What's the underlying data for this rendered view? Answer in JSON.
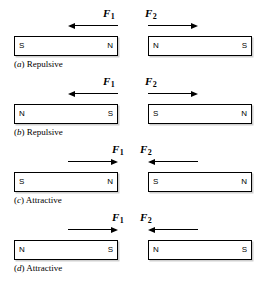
{
  "figure": {
    "force_labels": {
      "f1": "F",
      "f1_sub": "1",
      "f2": "F",
      "f2_sub": "2"
    },
    "rows": [
      {
        "id": "a",
        "tag_open": "(",
        "tag_letter": "a",
        "tag_close": ")",
        "caption": " Repulsive",
        "left_magnet": {
          "start_pole": "S",
          "end_pole": "N"
        },
        "right_magnet": {
          "start_pole": "N",
          "end_pole": "S"
        },
        "f1_direction": "left",
        "f2_direction": "right"
      },
      {
        "id": "b",
        "tag_open": "(",
        "tag_letter": "b",
        "tag_close": ")",
        "caption": " Repulsive",
        "left_magnet": {
          "start_pole": "N",
          "end_pole": "S"
        },
        "right_magnet": {
          "start_pole": "S",
          "end_pole": "N"
        },
        "f1_direction": "left",
        "f2_direction": "right"
      },
      {
        "id": "c",
        "tag_open": "(",
        "tag_letter": "c",
        "tag_close": ")",
        "caption": " Attractive",
        "left_magnet": {
          "start_pole": "S",
          "end_pole": "N"
        },
        "right_magnet": {
          "start_pole": "S",
          "end_pole": "N"
        },
        "f1_direction": "right",
        "f2_direction": "left"
      },
      {
        "id": "d",
        "tag_open": "(",
        "tag_letter": "d",
        "tag_close": ")",
        "caption": " Attractive",
        "left_magnet": {
          "start_pole": "N",
          "end_pole": "S"
        },
        "right_magnet": {
          "start_pole": "N",
          "end_pole": "S"
        },
        "f1_direction": "right",
        "f2_direction": "left"
      }
    ],
    "colors": {
      "stroke": "#000000",
      "background": "#ffffff",
      "shadow": "#cfcfcf"
    }
  }
}
